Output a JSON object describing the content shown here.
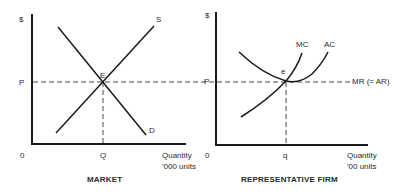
{
  "market": {
    "y_axis_label": "$",
    "origin_label": "0",
    "price_label": "P",
    "quantity_label": "Q",
    "x_axis_label_line1": "Quantity",
    "x_axis_label_line2": "'000 units",
    "supply_label": "S",
    "demand_label": "D",
    "equilibrium_label": "E",
    "caption": "MARKET"
  },
  "firm": {
    "y_axis_label": "$",
    "origin_label": "0",
    "price_label": "P",
    "quantity_label": "q",
    "x_axis_label_line1": "Quantity",
    "x_axis_label_line2": "'00 units",
    "mc_label": "MC",
    "ac_label": "AC",
    "mr_label": "MR (= AR)",
    "equilibrium_label": "e",
    "caption": "REPRESENTATIVE FIRM"
  },
  "colors": {
    "line": "#1a1a1a",
    "text": "#2a2a2a",
    "background": "#ffffff"
  }
}
